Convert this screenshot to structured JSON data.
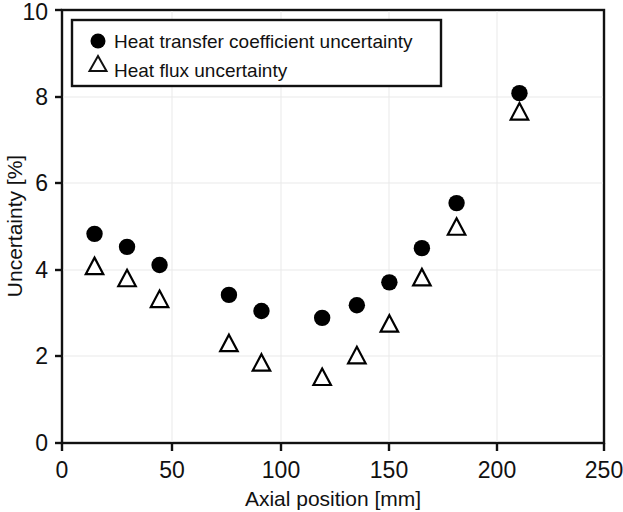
{
  "chart_data": {
    "type": "scatter",
    "title": "",
    "xlabel": "Axial position [mm]",
    "ylabel": "Uncertainty [%]",
    "xlim": [
      0,
      250
    ],
    "ylim": [
      0,
      10
    ],
    "xticks": [
      "0",
      "50",
      "100",
      "150",
      "200",
      "250"
    ],
    "yticks": [
      "0",
      "2",
      "4",
      "6",
      "8",
      "10"
    ],
    "xtick_values": [
      0,
      50,
      100,
      150,
      200,
      250
    ],
    "ytick_values": [
      0,
      2,
      4,
      6,
      8,
      10
    ],
    "grid": false,
    "legend_position": "upper-left-inside",
    "series": [
      {
        "name": "Heat transfer coefficient uncertainty",
        "marker": "filled-circle",
        "color": "#000000",
        "x": [
          15,
          30,
          45,
          77,
          92,
          120,
          136,
          151,
          166,
          182,
          211
        ],
        "values": [
          4.83,
          4.53,
          4.11,
          3.42,
          3.05,
          2.89,
          3.18,
          3.71,
          4.5,
          5.54,
          8.08
        ]
      },
      {
        "name": "Heat flux uncertainty",
        "marker": "open-triangle",
        "color": "#000000",
        "x": [
          15,
          30,
          45,
          77,
          92,
          120,
          136,
          151,
          166,
          182,
          211
        ],
        "values": [
          4.06,
          3.78,
          3.3,
          2.28,
          1.83,
          1.5,
          2.0,
          2.73,
          3.8,
          4.97,
          7.63
        ]
      }
    ]
  },
  "axes": {
    "x_title": "Axial position [mm]",
    "y_title": "Uncertainty [%]",
    "x_tick_0": "0",
    "x_tick_1": "50",
    "x_tick_2": "100",
    "x_tick_3": "150",
    "x_tick_4": "200",
    "x_tick_5": "250",
    "y_tick_0": "0",
    "y_tick_1": "2",
    "y_tick_2": "4",
    "y_tick_3": "6",
    "y_tick_4": "8",
    "y_tick_5": "10"
  },
  "legend": {
    "entry_1_label": "Heat transfer coefficient uncertainty",
    "entry_2_label": "Heat flux uncertainty"
  },
  "style": {
    "axis_color": "#111111",
    "marker_color": "#000000",
    "background": "#ffffff"
  }
}
